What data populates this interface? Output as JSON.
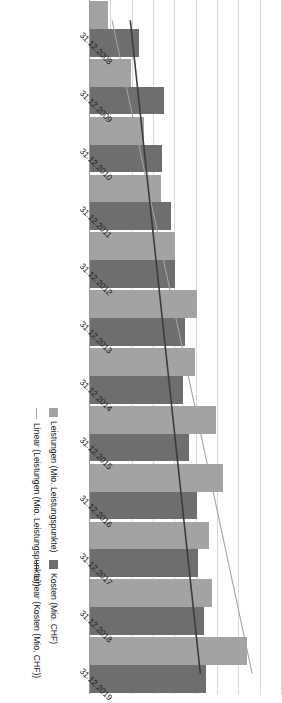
{
  "chart_data": {
    "type": "bar",
    "orientation": "rotated-90",
    "title": "",
    "xlabel": "",
    "ylabel": "",
    "grid": true,
    "legend_position": "bottom-right",
    "categories": [
      "31.12.2008",
      "31.12.2009",
      "31.12.2010",
      "31.12.2011",
      "31.12.2012",
      "31.12.2013",
      "31.12.2014",
      "31.12.2015",
      "31.12.2016",
      "31.12.2017",
      "31.12.2018",
      "31.12.2019"
    ],
    "ylim": [
      0,
      200
    ],
    "ytick_count": 9,
    "series": [
      {
        "name": "Leistungen (Mio. Leistungspunkte)",
        "color": "#a3a3a3",
        "kind": "bar",
        "values": [
          20,
          44,
          57,
          75,
          90,
          112,
          110,
          132,
          140,
          125,
          128,
          165
        ]
      },
      {
        "name": "Kosten (Mio. CHF)",
        "color": "#6e6e6e",
        "kind": "bar",
        "values": [
          52,
          78,
          76,
          85,
          90,
          100,
          98,
          104,
          112,
          114,
          120,
          122
        ]
      },
      {
        "name": "Linear (Leistungen (Mio. Leistungspunkte))",
        "color": "#a3a3a3",
        "kind": "trend",
        "start": 24,
        "end": 170
      },
      {
        "name": "Linear (Kosten (Mio. CHF))",
        "color": "#3c3c3c",
        "kind": "trend",
        "start": 43,
        "end": 116
      }
    ],
    "legend": [
      {
        "label": "Leistungen (Mio. Leistungspunkte)",
        "marker": "box",
        "color": "#a3a3a3"
      },
      {
        "label": "Linear (Leistungen (Mio. Leistungspunkte))",
        "marker": "line",
        "color": "#a3a3a3"
      },
      {
        "label": "Kosten (Mio. CHF)",
        "marker": "box",
        "color": "#6e6e6e"
      },
      {
        "label": "Linear (Kosten (Mio. CHF))",
        "marker": "line",
        "color": "#3c3c3c"
      }
    ]
  }
}
